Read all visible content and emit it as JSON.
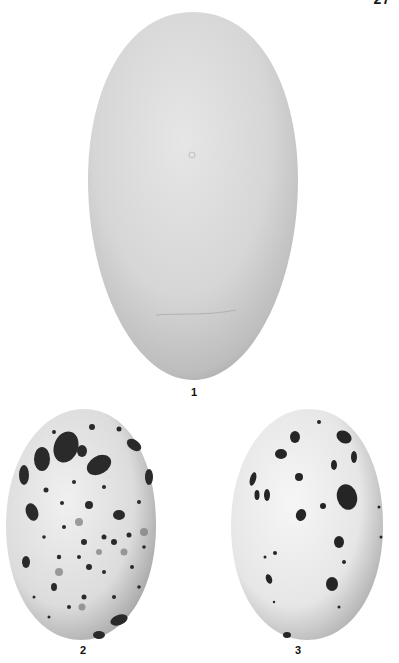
{
  "plate": {
    "page_number": "27",
    "background": "#ffffff"
  },
  "eggs": [
    {
      "label": "1",
      "description": "large plain unmarked egg, pale grey-white, elongated oval",
      "base_color": "#d8d8d8",
      "marked": false
    },
    {
      "label": "2",
      "description": "speckled egg with heavy dark blotches concentrated at broad end",
      "base_color": "#e2e2e2",
      "mark_color": "#2a2a2a",
      "marked": true
    },
    {
      "label": "3",
      "description": "white egg with sparse scattered dark spots and blotches",
      "base_color": "#ececec",
      "mark_color": "#252525",
      "marked": true
    }
  ]
}
